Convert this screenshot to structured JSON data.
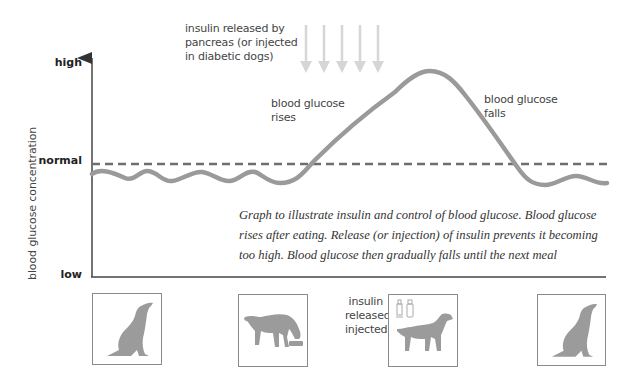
{
  "diagram": {
    "y_axis": {
      "title": "blood glucose concentration",
      "levels": {
        "high": "high",
        "normal": "normal",
        "low": "low"
      }
    },
    "annotations": {
      "insulin_release": "insulin released by\npancreas (or injected\nin diabetic dogs)",
      "rises": "blood glucose\nrises",
      "falls": "blood glucose\nfalls",
      "insulin_panel": "insulin\nreleased or\ninjected"
    },
    "caption": "Graph to illustrate insulin and control of blood glucose. Blood glucose\nrises after eating. Release (or injection) of insulin prevents it becoming\ntoo high. Blood glucose then gradually falls until the next meal",
    "insulin_arrow_count": 5,
    "stages": [
      {
        "id": "waiting",
        "description": "dog sitting, looking up"
      },
      {
        "id": "eating",
        "description": "dog eating from bowl"
      },
      {
        "id": "insulin",
        "description": "dog standing with insulin vials"
      },
      {
        "id": "waiting-again",
        "description": "dog sitting, looking up"
      }
    ],
    "colors": {
      "curve": "#9a9a9a",
      "normal_line": "#6e6e6e",
      "arrows": "#d6d6d6",
      "axis": "#444444",
      "silhouette": "#9b9b9b"
    }
  }
}
